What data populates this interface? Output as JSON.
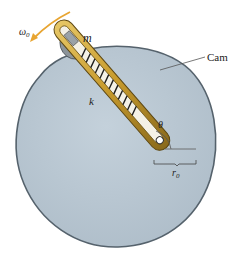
{
  "labels": {
    "omega": "ω",
    "omega_sub": "0",
    "mass": "m",
    "spring": "k",
    "cam": "Cam",
    "angle": "θ",
    "radius": "r",
    "radius_sub": "0"
  },
  "colors": {
    "cam_fill": "#b9c7d2",
    "cam_edge": "#5b6872",
    "slot_gold": "#c9a23a",
    "slot_dark": "#6b5318",
    "arrow": "#e8a531",
    "spring": "#222222",
    "leader": "#555555"
  }
}
